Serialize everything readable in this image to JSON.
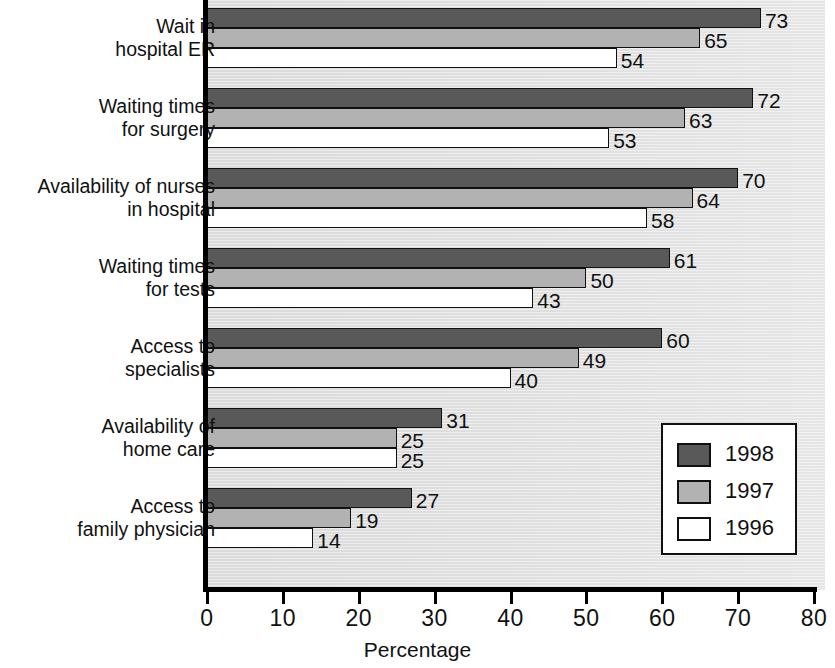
{
  "chart_data": {
    "type": "bar",
    "orientation": "horizontal",
    "title": "",
    "xlabel": "Percentage",
    "ylabel": "",
    "xlim": [
      0,
      80
    ],
    "xticks": [
      0,
      10,
      20,
      30,
      40,
      50,
      60,
      70,
      80
    ],
    "grid": false,
    "legend_position": "center-right",
    "categories": [
      "Wait in\nhospital ER",
      "Waiting times\nfor surgery",
      "Availability of nurses\nin hospital",
      "Waiting times\nfor tests",
      "Access to\nspecialists",
      "Availability of\nhome care",
      "Access to\nfamily physician"
    ],
    "series": [
      {
        "name": "1998",
        "color": "#595959",
        "values": [
          73,
          72,
          70,
          61,
          60,
          31,
          27
        ]
      },
      {
        "name": "1997",
        "color": "#b2b2b2",
        "values": [
          65,
          63,
          64,
          50,
          49,
          25,
          19
        ]
      },
      {
        "name": "1996",
        "color": "#ffffff",
        "values": [
          54,
          53,
          58,
          43,
          40,
          25,
          14
        ]
      }
    ]
  },
  "axis": {
    "x_title": "Percentage",
    "tick_labels": [
      "0",
      "10",
      "20",
      "30",
      "40",
      "50",
      "60",
      "70",
      "80"
    ]
  },
  "legend": {
    "entries": [
      {
        "label": "1998",
        "swatch": "dark-gray-swatch"
      },
      {
        "label": "1997",
        "swatch": "medium-gray-swatch"
      },
      {
        "label": "1996",
        "swatch": "white-swatch"
      }
    ]
  },
  "colors": {
    "series_1998": "#595959",
    "series_1997": "#b2b2b2",
    "series_1996": "#ffffff",
    "plot_background": "#e3e3e3",
    "axis": "#000000"
  }
}
